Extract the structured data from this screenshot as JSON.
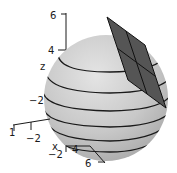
{
  "figure": {
    "colors": {
      "sphere_fill": "#c4c4c4",
      "sphere_highlight": "#e2e2e2",
      "contour": "#1a1a1a",
      "plane_fill": "#555555",
      "plane_edge": "#111111",
      "axis": "#1a1a1a"
    },
    "z_axis": {
      "label": "z",
      "ticks": [
        "6",
        "4",
        "-2"
      ]
    },
    "y_axis": {
      "ticks": [
        "1",
        "-2"
      ]
    },
    "x_axis": {
      "label": "x",
      "ticks": [
        "-2",
        "4",
        "6"
      ]
    }
  }
}
